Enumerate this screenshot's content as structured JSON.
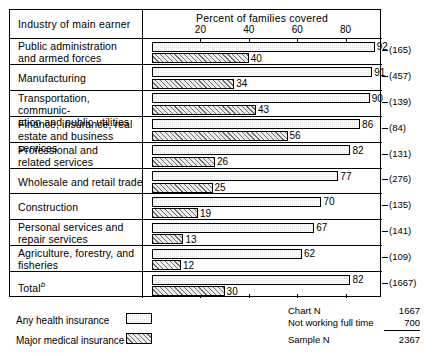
{
  "header": {
    "row_label_header": "Industry of main earner",
    "axis_title": "Percent of families covered"
  },
  "legend": {
    "items": [
      {
        "label": "Any health insurance",
        "pattern": "light-stipple",
        "color": "#e3e3e3"
      },
      {
        "label": "Major medical insurance",
        "pattern": "diagonal-hatch",
        "color": "#ececec"
      }
    ]
  },
  "stats": {
    "rows": [
      {
        "name": "Chart N",
        "value": "1667"
      },
      {
        "name": "Not working full time",
        "value": "700"
      }
    ],
    "total": {
      "name": "Sample N",
      "value": "2367"
    }
  },
  "chart_data": {
    "type": "bar",
    "orientation": "horizontal",
    "title": "Percent of families covered",
    "xlabel": "Percent of families covered",
    "ylabel": "Industry of main earner",
    "xlim": [
      0,
      100
    ],
    "xticks": [
      20,
      40,
      60,
      80
    ],
    "xtick_labels": [
      "20",
      "40",
      "60",
      "80"
    ],
    "grid": false,
    "legend_position": "below-left",
    "categories": [
      "Public administration and armed forces",
      "Manufacturing",
      "Transportation, communication and public utilities",
      "Finance, insurance, real estate and business services",
      "Professional and related services",
      "Wholesale and retail trade",
      "Construction",
      "Personal services and repair services",
      "Agriculture, forestry, and fisheries",
      "Total"
    ],
    "category_lines": [
      [
        "Public administration",
        "and armed forces"
      ],
      [
        "Manufacturing"
      ],
      [
        "Transportation, communic-",
        "ation and public utilities"
      ],
      [
        "Finance, insurance, real",
        "estate and business services"
      ],
      [
        "Professional and",
        "related services"
      ],
      [
        "Wholesale and retail trade"
      ],
      [
        "Construction"
      ],
      [
        "Personal services and",
        "repair services"
      ],
      [
        "Agriculture, forestry, and",
        "fisheries"
      ],
      [
        "Total"
      ]
    ],
    "total_footnote": "b",
    "series": [
      {
        "name": "Any health insurance",
        "values": [
          92,
          91,
          90,
          86,
          82,
          77,
          70,
          67,
          62,
          82
        ]
      },
      {
        "name": "Major medical insurance",
        "values": [
          40,
          34,
          43,
          56,
          26,
          25,
          19,
          13,
          12,
          30
        ]
      }
    ],
    "n_values": [
      "(165)",
      "(457)",
      "(139)",
      "(84)",
      "(131)",
      "(276)",
      "(135)",
      "(141)",
      "(109)",
      "(1667)"
    ]
  }
}
